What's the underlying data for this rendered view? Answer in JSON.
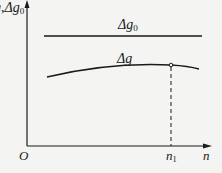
{
  "diagram": {
    "y_axis_label": "g,Δg",
    "y_axis_label_sub": "0",
    "x_axis_label": "n",
    "origin_label": "O",
    "curves": [
      {
        "name": "Δg",
        "sub": "0",
        "label": "Δg",
        "shape": "horizontal line"
      },
      {
        "name": "Δg",
        "sub": "",
        "label": "Δg",
        "shape": "convex curve with maximum at n1"
      }
    ],
    "marker_label": "n",
    "marker_label_sub": "1",
    "colors": {
      "line": "#1a1a1a",
      "background": "#f4f4f2"
    }
  }
}
